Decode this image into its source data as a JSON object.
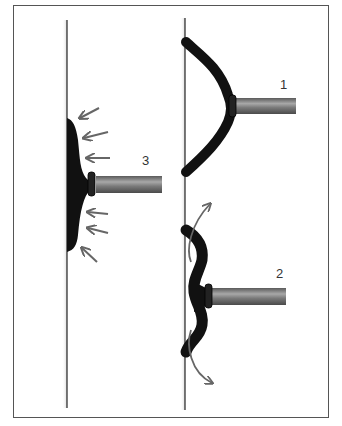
{
  "figure": {
    "labels": {
      "item1": "1",
      "item2": "2",
      "item3": "3"
    },
    "colors": {
      "wall": "#222222",
      "pad": "#111111",
      "arrow": "#666666",
      "frame": "#555555",
      "stem": "#8a8a8a"
    }
  }
}
